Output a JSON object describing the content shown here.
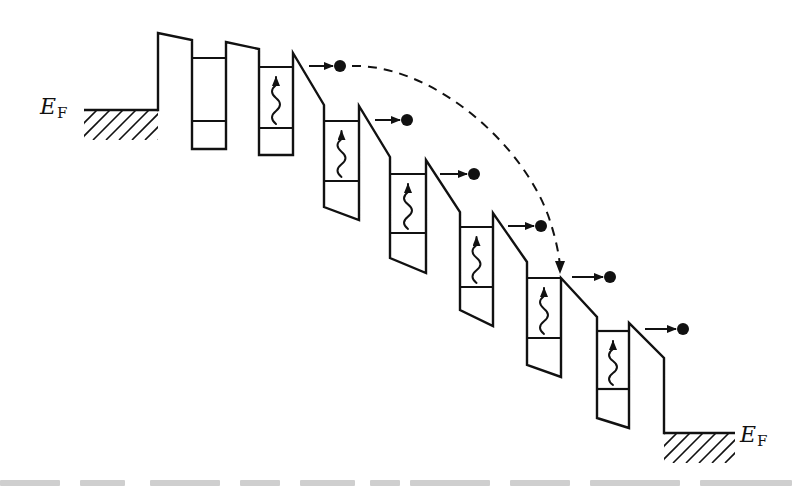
{
  "figure": {
    "width": 792,
    "height": 486,
    "ink_color": "#111111",
    "background": "#ffffff",
    "labels": {
      "left_fermi": {
        "main": "E",
        "sub": "F",
        "x": 40,
        "y": 114
      },
      "right_fermi": {
        "main": "E",
        "sub": "F",
        "x": 740,
        "y": 442
      }
    },
    "emitter": {
      "fermi_line": {
        "x1": 84,
        "x2": 158,
        "y": 110
      },
      "hatch_bottom": 140
    },
    "collector": {
      "fermi_line": {
        "x1": 664,
        "x2": 735,
        "y": 433
      },
      "hatch_bottom": 463
    },
    "band_edge_path": [
      [
        158,
        110
      ],
      [
        158,
        33
      ],
      [
        192,
        40
      ],
      [
        192,
        149
      ],
      [
        226,
        149
      ],
      [
        226,
        42
      ],
      [
        259,
        49
      ],
      [
        259,
        155
      ],
      [
        293,
        155
      ],
      [
        293,
        53
      ],
      [
        324,
        105
      ],
      [
        324,
        207
      ],
      [
        359,
        220
      ],
      [
        359,
        106
      ],
      [
        390,
        157
      ],
      [
        390,
        258
      ],
      [
        426,
        273
      ],
      [
        426,
        160
      ],
      [
        460,
        212
      ],
      [
        460,
        310
      ],
      [
        493,
        326
      ],
      [
        493,
        213
      ],
      [
        527,
        262
      ],
      [
        527,
        365
      ],
      [
        561,
        377
      ],
      [
        561,
        278
      ],
      [
        597,
        317
      ],
      [
        597,
        418
      ],
      [
        629,
        428
      ],
      [
        629,
        323
      ],
      [
        664,
        358
      ],
      [
        664,
        433
      ]
    ],
    "wells": [
      {
        "x1": 192,
        "x2": 226,
        "upper": 58,
        "lower": 121,
        "photon": false
      },
      {
        "x1": 259,
        "x2": 293,
        "upper": 67,
        "lower": 128,
        "photon": true
      },
      {
        "x1": 324,
        "x2": 359,
        "upper": 121,
        "lower": 181,
        "photon": true
      },
      {
        "x1": 390,
        "x2": 426,
        "upper": 174,
        "lower": 233,
        "photon": true
      },
      {
        "x1": 460,
        "x2": 493,
        "upper": 227,
        "lower": 287,
        "photon": true
      },
      {
        "x1": 527,
        "x2": 561,
        "upper": 278,
        "lower": 338,
        "photon": true
      },
      {
        "x1": 597,
        "x2": 629,
        "upper": 331,
        "lower": 389,
        "photon": true
      }
    ],
    "electrons": [
      {
        "arrow_x1": 309,
        "arrow_x2": 333,
        "x": 340,
        "y": 66
      },
      {
        "arrow_x1": 375,
        "arrow_x2": 400,
        "x": 407,
        "y": 120
      },
      {
        "arrow_x1": 440,
        "arrow_x2": 467,
        "x": 474,
        "y": 174
      },
      {
        "arrow_x1": 508,
        "arrow_x2": 534,
        "x": 541,
        "y": 226
      },
      {
        "arrow_x1": 572,
        "arrow_x2": 603,
        "x": 610,
        "y": 277
      },
      {
        "arrow_x1": 645,
        "arrow_x2": 676,
        "x": 683,
        "y": 329
      }
    ],
    "dashed_trajectory": {
      "path": "M 352 66 C 430 64, 520 140, 548 215 C 556 238, 559 255, 560 266",
      "arrow_tip": [
        560,
        274
      ]
    },
    "caption_fragments": [
      {
        "x": 0,
        "w": 60
      },
      {
        "x": 80,
        "w": 45
      },
      {
        "x": 150,
        "w": 70
      },
      {
        "x": 240,
        "w": 40
      },
      {
        "x": 300,
        "w": 55
      },
      {
        "x": 370,
        "w": 30
      },
      {
        "x": 410,
        "w": 80
      },
      {
        "x": 510,
        "w": 60
      },
      {
        "x": 590,
        "w": 90
      },
      {
        "x": 700,
        "w": 92
      }
    ]
  }
}
